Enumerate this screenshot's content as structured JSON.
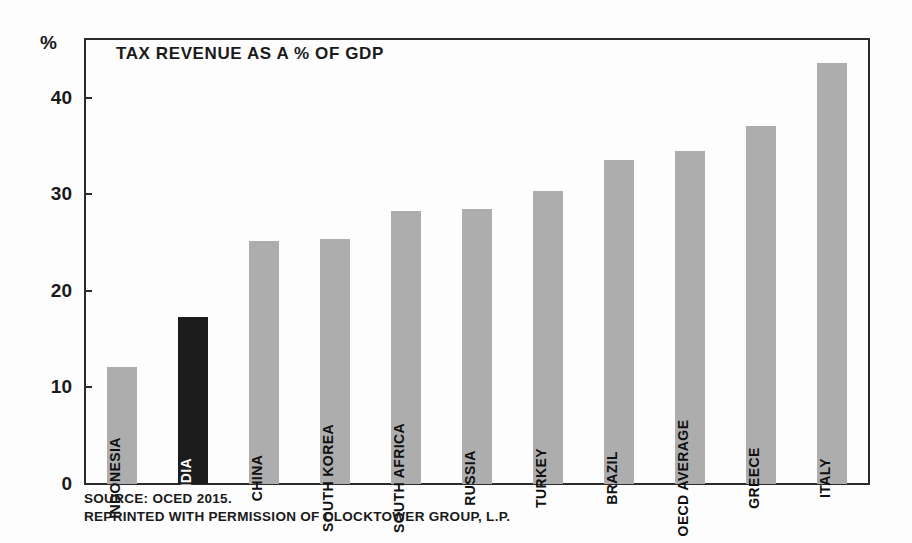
{
  "chart_data": {
    "type": "bar",
    "title": "TAX REVENUE AS A % OF GDP",
    "xlabel": "",
    "ylabel": "%",
    "ylim": [
      0,
      46
    ],
    "yticks": [
      0,
      10,
      20,
      30,
      40
    ],
    "ytick_labels": [
      "0",
      "10",
      "20",
      "30",
      "40"
    ],
    "grid": false,
    "legend": "none",
    "categories": [
      "INDONESIA",
      "INDIA",
      "CHINA",
      "SOUTH KOREA",
      "SOUTH AFRICA",
      "RUSSIA",
      "TURKEY",
      "BRAZIL",
      "OECD AVERAGE",
      "GREECE",
      "ITALY"
    ],
    "values": [
      12.1,
      17.3,
      25.2,
      25.4,
      28.3,
      28.5,
      30.4,
      33.6,
      34.5,
      37.1,
      43.6
    ],
    "highlight_category": "INDIA",
    "colors": {
      "bar": "#adadad",
      "highlight_bar": "#1c1c1c",
      "axis": "#2b2b2b",
      "text": "#1a1a1a",
      "background": "#fdfdfd"
    }
  },
  "axis": {
    "unit_label": "%"
  },
  "footer": {
    "line1": "SOURCE: OCED 2015.",
    "line2": "REPRINTED WITH PERMISSION OF CLOCKTOWER GROUP, L.P."
  }
}
